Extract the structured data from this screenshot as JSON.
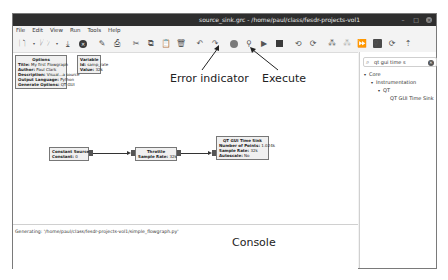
{
  "window": {
    "title": "source_sink.grc - /home/paul/class/fesdr-projects-vol1",
    "controls": [
      "minimize",
      "maximize",
      "close"
    ]
  },
  "menu": [
    "File",
    "Edit",
    "View",
    "Run",
    "Tools",
    "Help"
  ],
  "toolbar": {
    "icons": [
      "new-icon",
      "new-dropdown-icon",
      "open-icon",
      "open-dropdown-icon",
      "save-icon",
      "close-icon",
      "screenshot-icon",
      "print-icon",
      "cut-icon",
      "copy-icon",
      "paste-icon",
      "delete-icon",
      "undo-icon",
      "redo-icon",
      "error-indicator-icon",
      "generate-icon",
      "execute-icon",
      "kill-icon",
      "rotate-ccw-icon",
      "rotate-cw-icon",
      "enable-icon",
      "disable-icon",
      "bypass-icon",
      "hier-block-icon"
    ],
    "sidebar_icons": [
      "find-icon",
      "reload-icon",
      "open-hier-icon"
    ]
  },
  "blocks": {
    "options": {
      "title": "Options",
      "props": [
        {
          "k": "Title:",
          "v": "My first Flowgraph"
        },
        {
          "k": "Author:",
          "v": "Paul Clark"
        },
        {
          "k": "Description:",
          "v": "Visual...a source"
        },
        {
          "k": "Output Language:",
          "v": "Python"
        },
        {
          "k": "Generate Options:",
          "v": "QT GUI"
        }
      ]
    },
    "variable": {
      "title": "Variable",
      "props": [
        {
          "k": "Id:",
          "v": "samp_rate"
        },
        {
          "k": "Value:",
          "v": "32k"
        }
      ]
    },
    "constant_source": {
      "title": "Constant Source",
      "props": [
        {
          "k": "Constant:",
          "v": "0"
        }
      ]
    },
    "throttle": {
      "title": "Throttle",
      "props": [
        {
          "k": "Sample Rate:",
          "v": "32k"
        }
      ]
    },
    "qt_time_sink": {
      "title": "QT GUI Time Sink",
      "props": [
        {
          "k": "Number of Points:",
          "v": "1.024k"
        },
        {
          "k": "Sample Rate:",
          "v": "32k"
        },
        {
          "k": "Autoscale:",
          "v": "No"
        }
      ]
    }
  },
  "sidebar": {
    "search": {
      "value": "qt gui time s"
    },
    "tree": [
      {
        "label": "Core",
        "level": 0,
        "arrow": "▾"
      },
      {
        "label": "Instrumentation",
        "level": 1,
        "arrow": "▾"
      },
      {
        "label": "QT",
        "level": 2,
        "arrow": "▾"
      },
      {
        "label": "QT GUI Time Sink",
        "level": 3,
        "arrow": ""
      }
    ]
  },
  "console": {
    "text": "Generating: '/home/paul/class/fesdr-projects-vol1/simple_flowgraph.py'"
  },
  "annotations": {
    "error_indicator": "Error indicator",
    "execute": "Execute",
    "console": "Console"
  }
}
